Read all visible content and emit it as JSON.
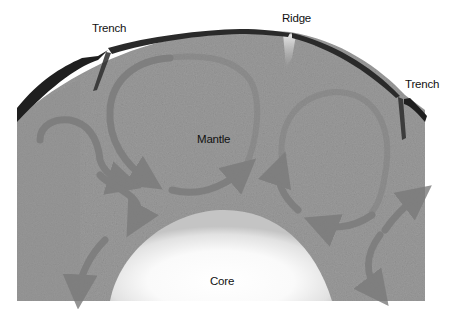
{
  "labels": {
    "trench_left": "Trench",
    "ridge": "Ridge",
    "trench_right": "Trench",
    "mantle": "Mantle",
    "core": "Core"
  },
  "colors": {
    "background": "#ffffff",
    "mantle": "#9a9a9a",
    "mantle_dark": "#8a8a8a",
    "crust": "#2a2a2a",
    "core_center": "#ffffff",
    "core_edge": "#c8c8c8",
    "arrow": "#7a7a7a",
    "ridge_glow": "#e0e0e0",
    "text": "#111111"
  },
  "features": [
    {
      "name": "Trench",
      "position": "upper-left",
      "type": "subduction zone"
    },
    {
      "name": "Ridge",
      "position": "top-center",
      "type": "spreading center"
    },
    {
      "name": "Trench",
      "position": "upper-right",
      "type": "subduction zone"
    },
    {
      "name": "Mantle",
      "position": "center",
      "type": "layer"
    },
    {
      "name": "Core",
      "position": "bottom-center",
      "type": "layer"
    }
  ],
  "convection_cells": [
    {
      "id": "left-cell",
      "direction": "counter-clockwise"
    },
    {
      "id": "center-cell",
      "direction": "clockwise"
    },
    {
      "id": "right-cell",
      "direction": "counter-clockwise"
    }
  ]
}
